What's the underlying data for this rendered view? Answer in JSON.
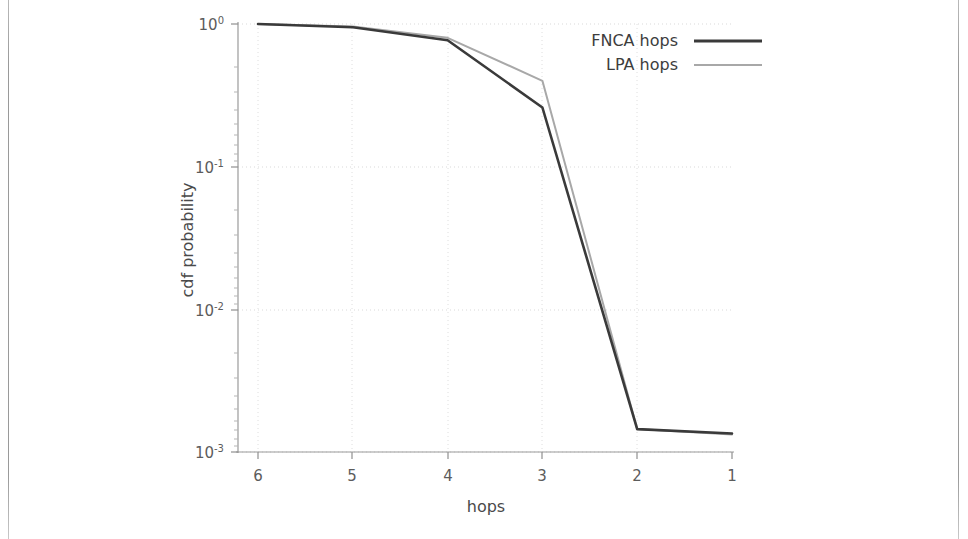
{
  "chart_data": {
    "type": "line",
    "title": "",
    "xlabel": "hops",
    "ylabel": "cdf probability",
    "x": [
      6,
      5,
      4,
      3,
      2,
      1
    ],
    "xtick_labels": [
      "6",
      "5",
      "4",
      "3",
      "2",
      "1"
    ],
    "x_axis_reversed": true,
    "xlim": [
      6,
      1
    ],
    "yscale": "log",
    "ylim": [
      0.001,
      1.0
    ],
    "ytick_values": [
      1.0,
      0.1,
      0.01,
      0.001
    ],
    "ytick_labels": [
      "10^0",
      "10^-1",
      "10^-2",
      "10^-3"
    ],
    "ytick_mantissas": [
      "10",
      "10",
      "10",
      "10"
    ],
    "ytick_exponents": [
      "0",
      "-1",
      "-2",
      "-3"
    ],
    "grid": true,
    "grid_style": "dotted",
    "legend_position": "top-right",
    "series": [
      {
        "name": "FNCA hops",
        "color": "#3a3a3a",
        "width": 2.6,
        "values": [
          1.0,
          0.95,
          0.77,
          0.26,
          0.00145,
          0.00135
        ]
      },
      {
        "name": "LPA hops",
        "color": "#a8a8a8",
        "width": 2.0,
        "values": [
          1.0,
          0.96,
          0.8,
          0.4,
          0.00145,
          0.00133
        ]
      }
    ]
  },
  "figure": {
    "background": "#ffffff",
    "axis_color": "#9a9a9a",
    "grid_color": "#d9d9d9",
    "tick_label_color": "#5c5c5c",
    "axis_title_color": "#4a4a4a"
  }
}
